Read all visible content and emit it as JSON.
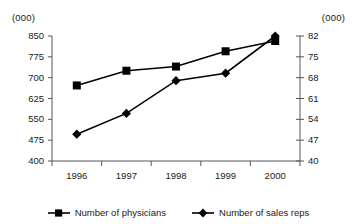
{
  "chart_data": {
    "type": "line",
    "title": "",
    "subtitle": "",
    "xlabel": "",
    "ylabel": "(000)",
    "y2label": "(000)",
    "categories": [
      "1996",
      "1997",
      "1998",
      "1999",
      "2000"
    ],
    "x": [
      1996,
      1997,
      1998,
      1999,
      2000
    ],
    "series": [
      {
        "name": "Number of physicians",
        "marker": "square",
        "axis": "left",
        "color": "#000000",
        "values": [
          672,
          725,
          740,
          795,
          832
        ]
      },
      {
        "name": "Number of sales reps",
        "marker": "diamond",
        "axis": "right",
        "color": "#000000",
        "values": [
          49,
          56,
          67,
          69.5,
          82
        ]
      }
    ],
    "ylim": [
      400,
      850
    ],
    "y2lim": [
      40,
      82
    ],
    "yticks": [
      850,
      775,
      700,
      625,
      550,
      475,
      400
    ],
    "y2ticks": [
      82,
      75,
      68,
      61,
      54,
      47,
      40
    ],
    "grid": false,
    "legend_position": "bottom"
  },
  "axes": {
    "left": {
      "unit": "(000)",
      "ticks": [
        "850",
        "775",
        "700",
        "625",
        "550",
        "475",
        "400"
      ]
    },
    "right": {
      "unit": "(000)",
      "ticks": [
        "82",
        "75",
        "68",
        "61",
        "54",
        "47",
        "40"
      ]
    },
    "x": {
      "ticks": [
        "1996",
        "1997",
        "1998",
        "1999",
        "2000"
      ]
    }
  },
  "legend": {
    "items": [
      {
        "label": "Number of physicians",
        "marker": "square"
      },
      {
        "label": "Number of sales reps",
        "marker": "diamond"
      }
    ]
  },
  "colors": {
    "ink": "#000000",
    "axis": "#555555",
    "background": "#ffffff"
  }
}
